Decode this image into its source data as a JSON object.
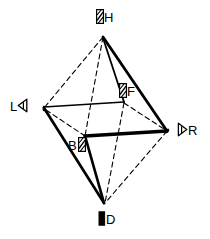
{
  "figure": {
    "type": "octahedron-axis-diagram",
    "background_color": "#ffffff",
    "line_color": "#000000",
    "canvas": {
      "width": 210,
      "height": 239
    },
    "vertices": [
      {
        "id": "H",
        "label": "H",
        "name": "head",
        "x": 103,
        "y": 37,
        "marker": "striped-bar",
        "marker_position": "left"
      },
      {
        "id": "L",
        "label": "L",
        "name": "left",
        "x": 44,
        "y": 108,
        "marker": "triangle-left",
        "marker_position": "right"
      },
      {
        "id": "R",
        "label": "R",
        "name": "right",
        "x": 167,
        "y": 131,
        "marker": "triangle-right",
        "marker_position": "left"
      },
      {
        "id": "D",
        "label": "D",
        "name": "down",
        "x": 104,
        "y": 203,
        "marker": "solid-bar",
        "marker_position": "left"
      },
      {
        "id": "F",
        "label": "F",
        "name": "front",
        "x": 124,
        "y": 103,
        "marker": "striped-bar",
        "marker_position": "left"
      },
      {
        "id": "B",
        "label": "B",
        "name": "back",
        "x": 85,
        "y": 136,
        "marker": "striped-bar",
        "marker_position": "right"
      }
    ],
    "labels": [
      {
        "id": "H",
        "text": "H",
        "x": 98,
        "y": 10,
        "marker": "striped-bar",
        "marker_side": "left"
      },
      {
        "id": "F",
        "text": "F",
        "x": 120,
        "y": 84,
        "marker": "striped-bar",
        "marker_side": "left"
      },
      {
        "id": "L",
        "text": "L",
        "x": 9,
        "y": 99,
        "marker": "triangle-left",
        "marker_side": "right"
      },
      {
        "id": "R",
        "text": "R",
        "x": 178,
        "y": 123,
        "marker": "triangle-right",
        "marker_side": "left"
      },
      {
        "id": "B",
        "text": "B",
        "x": 67,
        "y": 138,
        "marker": "striped-bar",
        "marker_side": "right"
      },
      {
        "id": "D",
        "text": "D",
        "x": 99,
        "y": 212,
        "marker": "solid-bar",
        "marker_side": "left"
      }
    ],
    "edges": [
      {
        "from": "H",
        "to": "F",
        "style": "solid",
        "weight": 1.6
      },
      {
        "from": "H",
        "to": "R",
        "style": "solid",
        "weight": 2.6
      },
      {
        "from": "L",
        "to": "F",
        "style": "solid",
        "weight": 1.6
      },
      {
        "from": "F",
        "to": "R",
        "style": "dashed",
        "weight": 1.1
      },
      {
        "from": "H",
        "to": "L",
        "style": "dashed",
        "weight": 1.1
      },
      {
        "from": "H",
        "to": "B",
        "style": "dashed",
        "weight": 1.1
      },
      {
        "from": "L",
        "to": "B",
        "style": "dashed",
        "weight": 1.1
      },
      {
        "from": "B",
        "to": "R",
        "style": "solid",
        "weight": 3.2
      },
      {
        "from": "L",
        "to": "B2",
        "style": "solid",
        "weight": 2.6
      },
      {
        "from": "B",
        "to": "D",
        "style": "solid",
        "weight": 2.6
      },
      {
        "from": "L",
        "to": "D",
        "style": "solid",
        "weight": 2.6
      },
      {
        "from": "F",
        "to": "D",
        "style": "dashed",
        "weight": 1.1
      },
      {
        "from": "R",
        "to": "D",
        "style": "dashed",
        "weight": 1.1
      },
      {
        "from": "B",
        "to": "Ddash",
        "style": "dashed",
        "weight": 1.1
      }
    ]
  }
}
